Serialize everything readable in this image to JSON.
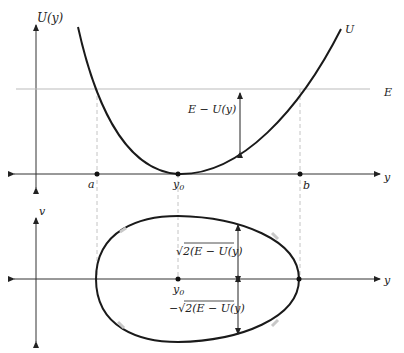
{
  "top_plot": {
    "y_axis_label": "U(y)",
    "x_axis_label": "y",
    "curve_label": "U",
    "energy_label": "E",
    "gap_label": "E − U(y)",
    "points": {
      "a": "a",
      "y0": "y",
      "y0_sub": "0",
      "b": "b"
    }
  },
  "bottom_plot": {
    "y_axis_label": "v",
    "x_axis_label": "y",
    "center_label": "y",
    "center_sub": "0",
    "upper_label": "√2(E − U(y)",
    "lower_label": "−√2(E − U(y)"
  },
  "colors": {
    "curve": "#1a1a1a",
    "axis": "#333333",
    "energy_line": "#bbbbbb",
    "dashed": "#bdbdbd",
    "highlight": "#c8c8c8"
  }
}
